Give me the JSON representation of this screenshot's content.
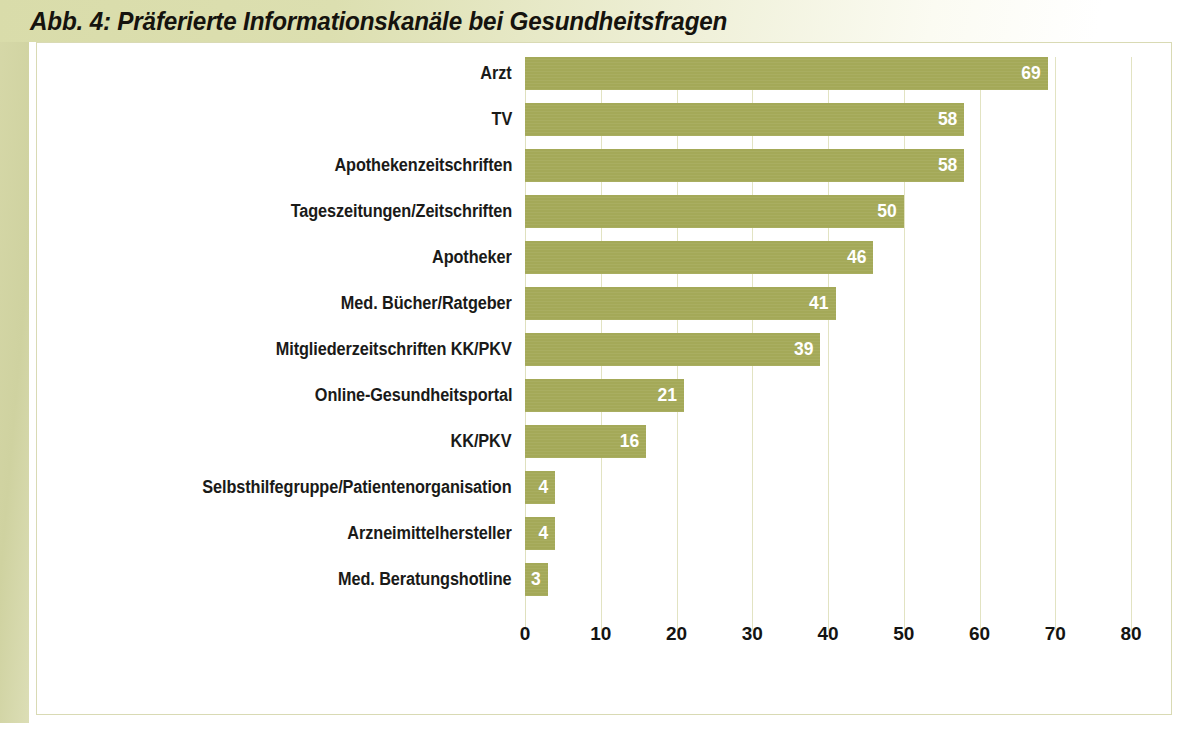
{
  "figure": {
    "title": "Abb. 4: Präferierte Informationskanäle bei Gesundheitsfragen",
    "frame_color": "#d6d8a8",
    "bar_color": "#a4a958",
    "grid_color": "#e2e3c2",
    "label_color": "#1a1a18",
    "value_label_color": "#ffffff",
    "panel_background": "#ffffff"
  },
  "chart_data": {
    "type": "bar",
    "orientation": "horizontal",
    "title": "Abb. 4: Präferierte Informationskanäle bei Gesundheitsfragen",
    "xlabel": "",
    "ylabel": "",
    "xlim": [
      0,
      80
    ],
    "xticks": [
      0,
      10,
      20,
      30,
      40,
      50,
      60,
      70,
      80
    ],
    "xtick_labels": [
      "0",
      "10",
      "20",
      "30",
      "40",
      "50",
      "60",
      "70",
      "80"
    ],
    "grid": "vertical",
    "legend": "none",
    "categories": [
      "Arzt",
      "TV",
      "Apothekenzeitschriften",
      "Tageszeitungen/Zeitschriften",
      "Apotheker",
      "Med. Bücher/Ratgeber",
      "Mitgliederzeitschriften KK/PKV",
      "Online-Gesundheitsportal",
      "KK/PKV",
      "Selbsthilfegruppe/Patientenorganisation",
      "Arzneimittelhersteller",
      "Med. Beratungshotline"
    ],
    "values": [
      69,
      58,
      58,
      50,
      46,
      41,
      39,
      21,
      16,
      4,
      4,
      3
    ],
    "value_labels": [
      "69",
      "58",
      "58",
      "50",
      "46",
      "41",
      "39",
      "21",
      "16",
      "4",
      "4",
      "3"
    ],
    "series": [
      {
        "name": "Präferierte Informationskanäle",
        "values": [
          69,
          58,
          58,
          50,
          46,
          41,
          39,
          21,
          16,
          4,
          4,
          3
        ]
      }
    ]
  }
}
